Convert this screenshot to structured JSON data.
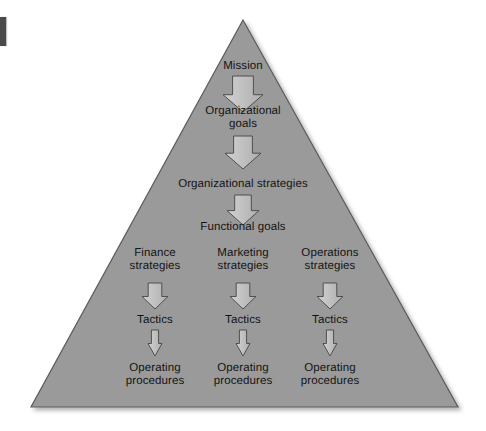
{
  "diagram": {
    "type": "pyramid-hierarchy-flowchart",
    "title_text": "",
    "shape": {
      "name": "triangle",
      "fill_color": "#9a9a9a",
      "stroke_color": "#555555",
      "apex": {
        "x": 243,
        "y": 20
      },
      "bottom_left": {
        "x": 31,
        "y": 407
      },
      "bottom_right": {
        "x": 458,
        "y": 407
      }
    },
    "arrow_style": {
      "fill_color": "#b9b9b9",
      "stroke_color": "#4f4f4f",
      "highlight_color": "#d2d2d2"
    },
    "levels": [
      {
        "id": "mission",
        "label": "Mission",
        "center_x": 243,
        "center_y": 66,
        "arrow_after": {
          "width": 40,
          "height": 36,
          "top": 76
        }
      },
      {
        "id": "organizational-goals",
        "label": "Organizational\ngoals",
        "center_x": 243,
        "center_y": 118,
        "arrow_after": {
          "width": 36,
          "height": 33,
          "top": 136
        }
      },
      {
        "id": "organizational-strategies",
        "label": "Organizational strategies",
        "center_x": 243,
        "center_y": 184,
        "arrow_after": {
          "width": 32,
          "height": 30,
          "top": 195
        }
      },
      {
        "id": "functional-goals",
        "label": "Functional goals",
        "center_x": 243,
        "center_y": 227,
        "arrow_after": null
      }
    ],
    "columns": [
      {
        "id": "finance",
        "center_x": 155,
        "strategy_label": "Finance\nstrategies",
        "strategy_center_y": 260,
        "strategy_arrow": {
          "width": 26,
          "height": 26,
          "top": 283
        },
        "tactics_label": "Tactics",
        "tactics_center_y": 320,
        "tactics_arrow": {
          "width": 14,
          "height": 26,
          "top": 330
        },
        "procedures_label": "Operating\nprocedures",
        "procedures_center_y": 375
      },
      {
        "id": "marketing",
        "center_x": 243,
        "strategy_label": "Marketing\nstrategies",
        "strategy_center_y": 260,
        "strategy_arrow": {
          "width": 26,
          "height": 26,
          "top": 283
        },
        "tactics_label": "Tactics",
        "tactics_center_y": 320,
        "tactics_arrow": {
          "width": 14,
          "height": 26,
          "top": 330
        },
        "procedures_label": "Operating\nprocedures",
        "procedures_center_y": 375
      },
      {
        "id": "operations",
        "center_x": 330,
        "strategy_label": "Operations\nstrategies",
        "strategy_center_y": 260,
        "strategy_arrow": {
          "width": 26,
          "height": 26,
          "top": 283
        },
        "tactics_label": "Tactics",
        "tactics_center_y": 320,
        "tactics_arrow": {
          "width": 14,
          "height": 26,
          "top": 330
        },
        "procedures_label": "Operating\nprocedures",
        "procedures_center_y": 375
      }
    ]
  }
}
